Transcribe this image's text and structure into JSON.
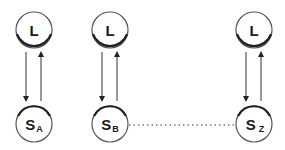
{
  "diagram": {
    "title": "",
    "columns": [
      {
        "id": "A",
        "top": {
          "label": "L",
          "cx": 34,
          "cy": 30
        },
        "bottom": {
          "label": "S",
          "sub": "A",
          "cx": 34,
          "cy": 124
        },
        "arrows": [
          {
            "direction": "down",
            "x": 26
          },
          {
            "direction": "up",
            "x": 41
          }
        ]
      },
      {
        "id": "B",
        "top": {
          "label": "L",
          "cx": 110,
          "cy": 30
        },
        "bottom": {
          "label": "S",
          "sub": "B",
          "cx": 110,
          "cy": 124
        },
        "arrows": [
          {
            "direction": "down",
            "x": 102
          },
          {
            "direction": "up",
            "x": 117
          }
        ]
      },
      {
        "id": "Z",
        "top": {
          "label": "L",
          "cx": 254,
          "cy": 30
        },
        "bottom": {
          "label": "S",
          "sub": "Z",
          "cx": 254,
          "cy": 124
        },
        "arrows": [
          {
            "direction": "down",
            "x": 246
          },
          {
            "direction": "up",
            "x": 261
          }
        ]
      }
    ],
    "connector": {
      "style": "dotted",
      "from": "S_B",
      "to": "S_Z"
    },
    "colors": {
      "stroke": "#333333",
      "background": "#ffffff"
    }
  }
}
